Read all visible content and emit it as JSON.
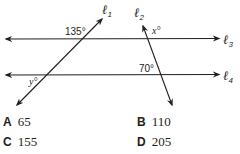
{
  "figure": {
    "lines": {
      "l1": {
        "name": "ℓ",
        "sub": "1"
      },
      "l2": {
        "name": "ℓ",
        "sub": "2"
      },
      "l3": {
        "name": "ℓ",
        "sub": "3"
      },
      "l4": {
        "name": "ℓ",
        "sub": "4"
      }
    },
    "angles": {
      "a135": "135°",
      "a70": "70°",
      "x": "x°",
      "y": "y°"
    },
    "color": "#231f20"
  },
  "choices": [
    {
      "letter": "A",
      "value": "65"
    },
    {
      "letter": "B",
      "value": "110"
    },
    {
      "letter": "C",
      "value": "155"
    },
    {
      "letter": "D",
      "value": "205"
    }
  ]
}
